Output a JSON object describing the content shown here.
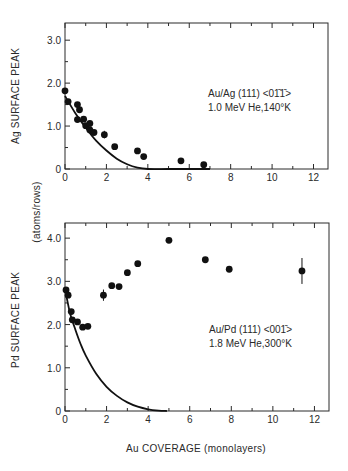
{
  "chart_data": [
    {
      "type": "scatter",
      "title": "",
      "xlabel": "Au COVERAGE (monolayers)",
      "ylabel": "Ag SURFACE PEAK",
      "xlim": [
        0,
        12.7
      ],
      "ylim": [
        0,
        34
      ],
      "xticks": [
        0,
        2,
        4,
        6,
        8,
        10,
        12
      ],
      "yticks": [
        0,
        10,
        20,
        30
      ],
      "ytick_labels": [
        "0",
        "1.0",
        "2.0",
        "3.0"
      ],
      "grid": false,
      "annotation": [
        "Au/Ag (111) <01̄1̄>",
        "1.0 MeV He,140°K"
      ],
      "series": [
        {
          "name": "data",
          "style": "markers",
          "x": [
            0.0,
            0.15,
            0.6,
            0.7,
            0.6,
            0.9,
            1.0,
            1.2,
            1.2,
            1.4,
            1.9,
            2.4,
            3.5,
            3.8,
            5.6,
            6.7
          ],
          "y": [
            18.2,
            15.7,
            15.0,
            13.8,
            11.5,
            11.6,
            10.1,
            10.6,
            9.1,
            8.5,
            8.0,
            5.2,
            4.2,
            2.9,
            1.9,
            1.0
          ],
          "yerr": [
            0,
            0,
            0,
            0,
            0,
            0,
            0,
            0,
            0,
            0,
            0.9,
            0,
            0,
            0,
            0,
            0
          ]
        },
        {
          "name": "model curve",
          "style": "line",
          "x": [
            0,
            0.5,
            1.0,
            1.5,
            2.0,
            2.5,
            3.0,
            3.5,
            4.0,
            5.0,
            6.0,
            7.0
          ],
          "y": [
            17.0,
            13.0,
            9.6,
            6.6,
            4.3,
            2.4,
            1.1,
            0.3,
            0.0,
            0.0,
            0.0,
            0.0
          ]
        }
      ]
    },
    {
      "type": "scatter",
      "title": "",
      "xlabel": "Au COVERAGE (monolayers)",
      "ylabel": "Pd SURFACE PEAK (atoms/rows)",
      "xlim": [
        0,
        12.7
      ],
      "ylim": [
        0,
        43.5
      ],
      "xticks": [
        0,
        2,
        4,
        6,
        8,
        10,
        12
      ],
      "yticks": [
        0,
        10,
        20,
        30,
        40
      ],
      "ytick_labels": [
        "0",
        "1.0",
        "2.0",
        "3.0",
        "4.0"
      ],
      "grid": false,
      "annotation": [
        "Au/Pd (111) <001̄>",
        "1.8 MeV He,300°K"
      ],
      "series": [
        {
          "name": "data",
          "style": "markers",
          "x": [
            0.05,
            0.15,
            0.3,
            0.35,
            0.6,
            0.85,
            1.1,
            1.85,
            2.25,
            2.6,
            3.0,
            3.5,
            5.0,
            6.75,
            7.9,
            11.4
          ],
          "y": [
            28.0,
            26.8,
            23.0,
            21.1,
            20.6,
            19.4,
            19.6,
            26.8,
            29.0,
            28.8,
            32.0,
            34.1,
            39.5,
            35.0,
            32.8,
            32.4
          ],
          "yerr": [
            0,
            0,
            0,
            0,
            0,
            0,
            0,
            1.3,
            0,
            0,
            0,
            0,
            0,
            0,
            0,
            3.0
          ]
        },
        {
          "name": "model curve",
          "style": "line",
          "x": [
            0.05,
            0.25,
            0.5,
            0.75,
            1.0,
            1.5,
            2.0,
            2.5,
            3.0,
            3.5,
            4.0,
            4.5,
            4.9
          ],
          "y": [
            27.0,
            22.5,
            18.8,
            15.5,
            12.8,
            8.6,
            5.6,
            3.5,
            2.0,
            1.0,
            0.4,
            0.1,
            0.0
          ]
        }
      ]
    }
  ],
  "panels": {
    "top": {
      "ylabel": "Ag SURFACE PEAK",
      "annotation_line1": "Au/Ag (111) <01̄1̄>",
      "annotation_line2": "1.0 MeV He,140°K",
      "xtick_labels": [
        "0",
        "2",
        "4",
        "6",
        "8",
        "10",
        "12"
      ],
      "ytick_labels": [
        "0",
        "1.0",
        "2.0",
        "3.0"
      ]
    },
    "bottom": {
      "ylabel": "Pd SURFACE PEAK",
      "ylabel_units": "(atoms/rows)",
      "annotation_line1": "Au/Pd (111) <001̄>",
      "annotation_line2": "1.8 MeV He,300°K",
      "xtick_labels": [
        "0",
        "2",
        "4",
        "6",
        "8",
        "10",
        "12"
      ],
      "ytick_labels": [
        "0",
        "1.0",
        "2.0",
        "3.0",
        "4.0"
      ],
      "xlabel": "Au COVERAGE (monolayers)"
    }
  }
}
